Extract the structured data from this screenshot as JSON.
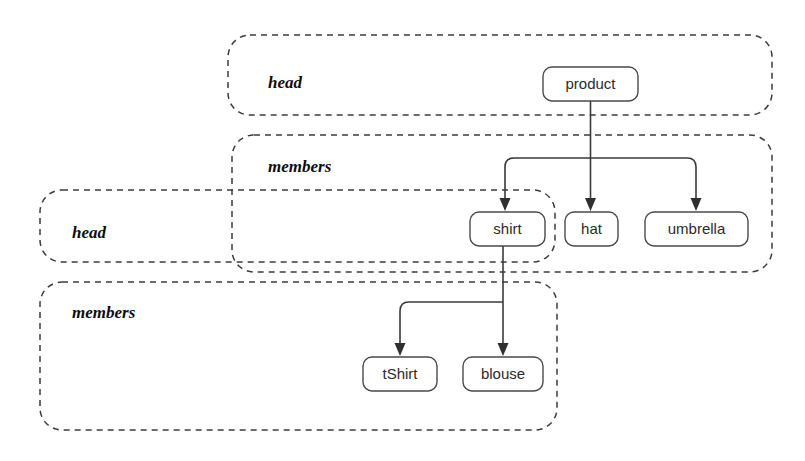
{
  "diagram": {
    "colors": {
      "background": "#ffffff",
      "group_border": "#3c3c3c",
      "node_border": "#4a4a4a",
      "node_fill": "#ffffff",
      "edge": "#3a3a3a",
      "label_text": "#0d0d0d",
      "node_text": "#2b2b2b"
    },
    "groups": [
      {
        "id": "head-outer",
        "label": "head",
        "x": 228,
        "y": 35,
        "w": 544,
        "h": 80,
        "label_x": 268,
        "label_y": 88
      },
      {
        "id": "members-outer",
        "label": "members",
        "x": 232,
        "y": 135,
        "w": 540,
        "h": 137,
        "label_x": 268,
        "label_y": 172
      },
      {
        "id": "head-inner",
        "label": "head",
        "x": 40,
        "y": 190,
        "w": 515,
        "h": 72,
        "label_x": 72,
        "label_y": 238
      },
      {
        "id": "members-inner",
        "label": "members",
        "x": 40,
        "y": 282,
        "w": 517,
        "h": 148,
        "label_x": 72,
        "label_y": 318
      }
    ],
    "nodes": [
      {
        "id": "product",
        "label": "product",
        "x": 543,
        "y": 67,
        "w": 95,
        "h": 34
      },
      {
        "id": "shirt",
        "label": "shirt",
        "x": 470,
        "y": 212,
        "w": 75,
        "h": 34
      },
      {
        "id": "hat",
        "label": "hat",
        "x": 565,
        "y": 212,
        "w": 53,
        "h": 34
      },
      {
        "id": "umbrella",
        "label": "umbrella",
        "x": 645,
        "y": 212,
        "w": 103,
        "h": 34
      },
      {
        "id": "tShirt",
        "label": "tShirt",
        "x": 363,
        "y": 357,
        "w": 74,
        "h": 34
      },
      {
        "id": "blouse",
        "label": "blouse",
        "x": 463,
        "y": 357,
        "w": 80,
        "h": 34
      }
    ],
    "edges": [
      {
        "id": "product-to-shirt",
        "from": "product",
        "to": "shirt"
      },
      {
        "id": "product-to-hat",
        "from": "product",
        "to": "hat"
      },
      {
        "id": "product-to-umbrella",
        "from": "product",
        "to": "umbrella"
      },
      {
        "id": "shirt-to-tShirt",
        "from": "shirt",
        "to": "tShirt"
      },
      {
        "id": "shirt-to-blouse",
        "from": "shirt",
        "to": "blouse"
      }
    ]
  }
}
